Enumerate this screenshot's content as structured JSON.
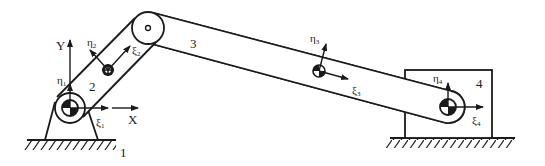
{
  "figure": {
    "colors": {
      "stroke": "#1a1a1a",
      "background": "#ffffff"
    }
  },
  "global_axes": {
    "x_label": "X",
    "y_label": "Y"
  },
  "bodies": [
    {
      "id": "1",
      "label": "1",
      "name": "ground"
    },
    {
      "id": "2",
      "label": "2",
      "name": "crank"
    },
    {
      "id": "3",
      "label": "3",
      "name": "connecting-rod"
    },
    {
      "id": "4",
      "label": "4",
      "name": "slider"
    }
  ],
  "frames": [
    {
      "body": "1",
      "xi": "ξ",
      "xi_sub": "1",
      "eta": "η",
      "eta_sub": "1"
    },
    {
      "body": "2",
      "xi": "ξ",
      "xi_sub": "2",
      "eta": "η",
      "eta_sub": "2"
    },
    {
      "body": "3",
      "xi": "ξ",
      "xi_sub": "3",
      "eta": "η",
      "eta_sub": "3"
    },
    {
      "body": "4",
      "xi": "ξ",
      "xi_sub": "4",
      "eta": "η",
      "eta_sub": "4"
    }
  ]
}
